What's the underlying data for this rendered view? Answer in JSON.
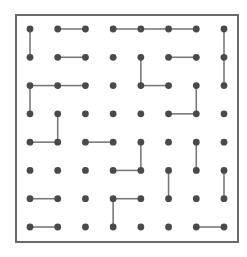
{
  "puzzle": {
    "type": "dot-grid-path-segments",
    "cols": 8,
    "rows": 8,
    "colors": {
      "background": "#ffffff",
      "border": "#6a6a6a",
      "dot": "#4a4a4a",
      "line": "#7a7a7a"
    },
    "horizontal_edges": [
      [
        0,
        1,
        2
      ],
      [
        0,
        3,
        4
      ],
      [
        0,
        4,
        5
      ],
      [
        0,
        5,
        6
      ],
      [
        1,
        1,
        2
      ],
      [
        1,
        5,
        6
      ],
      [
        2,
        0,
        1
      ],
      [
        2,
        1,
        2
      ],
      [
        2,
        4,
        5
      ],
      [
        3,
        5,
        6
      ],
      [
        4,
        0,
        1
      ],
      [
        4,
        2,
        3
      ],
      [
        5,
        3,
        4
      ],
      [
        6,
        0,
        1
      ],
      [
        6,
        3,
        4
      ],
      [
        7,
        0,
        1
      ],
      [
        7,
        6,
        7
      ]
    ],
    "vertical_edges": [
      [
        0,
        0,
        1
      ],
      [
        7,
        0,
        1
      ],
      [
        4,
        1,
        2
      ],
      [
        7,
        1,
        2
      ],
      [
        0,
        2,
        3
      ],
      [
        6,
        2,
        3
      ],
      [
        1,
        3,
        4
      ],
      [
        4,
        4,
        5
      ],
      [
        6,
        4,
        5
      ],
      [
        5,
        5,
        6
      ],
      [
        7,
        5,
        6
      ],
      [
        3,
        6,
        7
      ]
    ]
  }
}
